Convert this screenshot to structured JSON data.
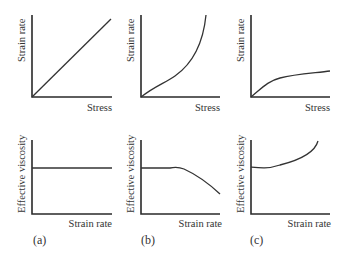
{
  "panels": [
    {
      "id": "a",
      "label": "(a)",
      "top": {
        "xlabel": "Stress",
        "ylabel": "Strain rate",
        "shape": "linear"
      },
      "bottom": {
        "xlabel": "Strain rate",
        "ylabel": "Effective viscosity",
        "shape": "constant"
      }
    },
    {
      "id": "b",
      "label": "(b)",
      "top": {
        "xlabel": "Stress",
        "ylabel": "Strain rate",
        "shape": "increasing-convex"
      },
      "bottom": {
        "xlabel": "Strain rate",
        "ylabel": "Effective viscosity",
        "shape": "constant-then-decreasing"
      }
    },
    {
      "id": "c",
      "label": "(c)",
      "top": {
        "xlabel": "Stress",
        "ylabel": "Strain rate",
        "shape": "increasing-concave"
      },
      "bottom": {
        "xlabel": "Strain rate",
        "ylabel": "Effective viscosity",
        "shape": "slight-dip-then-increasing"
      }
    }
  ],
  "colors": {
    "ink": "#2a2a2a",
    "background": "#ffffff"
  }
}
